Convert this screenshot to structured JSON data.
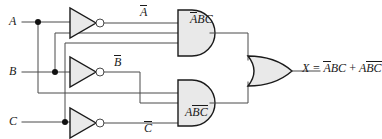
{
  "diagram": {
    "type": "logic-circuit",
    "colors": {
      "wire": "#4a4a4a",
      "gate_outline": "#1a1a1a",
      "gate_fill": "#e9e9e9",
      "junction_dot": "#111111",
      "background": "#ffffff"
    }
  },
  "inputs": [
    {
      "id": "A",
      "label": "A",
      "y": 22
    },
    {
      "id": "B",
      "label": "B",
      "y": 72
    },
    {
      "id": "C",
      "label": "C",
      "y": 122
    }
  ],
  "inverters": [
    {
      "id": "inv-a",
      "input": "A",
      "output_label_base": "A",
      "output_label": "A",
      "overbar": true
    },
    {
      "id": "inv-b",
      "input": "B",
      "output_label_base": "B",
      "output_label": "B",
      "overbar": true
    },
    {
      "id": "inv-c",
      "input": "C",
      "output_label_base": "C",
      "output_label": "C",
      "overbar": true
    }
  ],
  "and_gates": [
    {
      "id": "and-top",
      "inputs": [
        "A-bar",
        "B",
        "C"
      ],
      "output_parts": [
        {
          "text": "A",
          "overbar": true
        },
        {
          "text": "BC",
          "overbar": false
        }
      ],
      "output_plain": "ABC"
    },
    {
      "id": "and-bottom",
      "inputs": [
        "A",
        "B-bar",
        "C-bar"
      ],
      "output_parts": [
        {
          "text": "A",
          "overbar": false
        },
        {
          "text": "BC",
          "overbar": true
        }
      ],
      "output_plain": "ABC"
    }
  ],
  "or_gate": {
    "id": "or-out",
    "inputs": [
      "and-top",
      "and-bottom"
    ],
    "output_prefix": "X =",
    "output_term1": [
      {
        "text": "A",
        "overbar": true
      },
      {
        "text": "BC",
        "overbar": false
      }
    ],
    "output_operator": "+",
    "output_term2": [
      {
        "text": "A",
        "overbar": false
      },
      {
        "text": "BC",
        "overbar": true
      }
    ],
    "output_plain": "X = ABC + ABC"
  },
  "labels": {
    "in_a": "A",
    "in_b": "B",
    "in_c": "C",
    "not_a": "A",
    "not_b": "B",
    "not_c": "C",
    "and_top_a": "A",
    "and_top_bc": "BC",
    "and_bot_a": "A",
    "and_bot_bc": "BC",
    "x_prefix": "X =",
    "x_t1_a": "A",
    "x_t1_bc": "BC",
    "x_plus": "+",
    "x_t2_a": "A",
    "x_t2_bc": "BC"
  }
}
